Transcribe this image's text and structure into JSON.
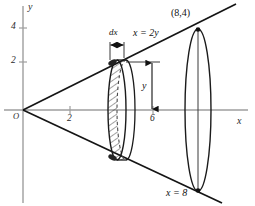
{
  "figure": {
    "title_alt": "Volume of revolution: cone generated by line x = 2y about the x-axis",
    "axes": {
      "x_axis_label": "x",
      "y_axis_label": "y",
      "origin_label": "O",
      "x_ticks": [
        {
          "value": 2,
          "label": "2"
        },
        {
          "value": 6,
          "label": "6"
        }
      ],
      "y_ticks": [
        {
          "value": 2,
          "label": "2"
        },
        {
          "value": 4,
          "label": "4"
        }
      ],
      "axis_color": "#9a9a9a"
    },
    "annotations": {
      "line_equation": "x = 2y",
      "point_label": "(8,4)",
      "plane_label": "x = 8",
      "thickness_label": "dx",
      "radius_label": "y"
    },
    "geometry": {
      "cone_apex": "O",
      "cone_slope_upper_through": "(8,4)",
      "cone_slope_lower_through": "(8,-4)",
      "slice_position_x": "between 4 and 5",
      "slice_radius_symbol": "y",
      "slice_thickness_symbol": "dx"
    },
    "colors": {
      "ink": "#111111",
      "axis": "#9a9a9a",
      "hatch": "#333333",
      "dashed": "#555555"
    }
  }
}
